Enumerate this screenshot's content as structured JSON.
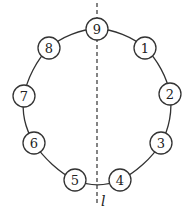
{
  "diagram": {
    "type": "circle-of-numbered-nodes-with-symmetry-line",
    "colors": {
      "stroke": "#333333",
      "fill": "#ffffff",
      "text": "#222222"
    },
    "circle": {
      "cx": 97,
      "cy": 106,
      "rx": 73,
      "ry": 77
    },
    "node_radius": 11,
    "nodes": [
      {
        "label": "1",
        "x": 145,
        "y": 48
      },
      {
        "label": "2",
        "x": 170,
        "y": 94
      },
      {
        "label": "3",
        "x": 161,
        "y": 143
      },
      {
        "label": "4",
        "x": 120,
        "y": 180
      },
      {
        "label": "5",
        "x": 75,
        "y": 180
      },
      {
        "label": "6",
        "x": 34,
        "y": 143
      },
      {
        "label": "7",
        "x": 24,
        "y": 96
      },
      {
        "label": "8",
        "x": 49,
        "y": 48
      },
      {
        "label": "9",
        "x": 97,
        "y": 29
      }
    ],
    "symmetry_line": {
      "label": "l",
      "x": 97,
      "y1": 3,
      "y2": 203,
      "style": "dashed"
    }
  }
}
